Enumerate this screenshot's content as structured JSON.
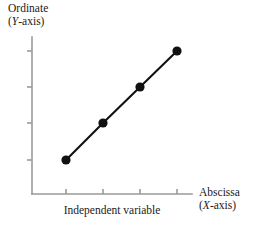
{
  "figure": {
    "background_color": "#ffffff",
    "axis_color": "#9a9a9a",
    "series_color": "#111111",
    "text_color": "#1a1a1a"
  },
  "captions": {
    "ordinate": {
      "name": "Ordinate",
      "axis_label_prefix": "(",
      "axis_letter": "Y",
      "axis_label_suffix": "-axis)"
    },
    "abscissa": {
      "name": "Abscissa",
      "axis_label_prefix": "(",
      "axis_letter": "X",
      "axis_label_suffix": "-axis)"
    }
  },
  "chart_data": {
    "type": "line",
    "title": "",
    "xlabel": "Independent variable",
    "ylabel": "Dependent variable",
    "x": [
      1,
      2,
      3,
      4
    ],
    "values": [
      1,
      2,
      3,
      4
    ],
    "xlim": [
      0,
      5
    ],
    "ylim": [
      0,
      5
    ],
    "xtick_labels": [
      "",
      "",
      "",
      ""
    ],
    "ytick_labels": [
      "",
      "",
      "",
      ""
    ],
    "grid": false,
    "legend": false,
    "marker": "filled-circle",
    "annotations": [
      "Ordinate (Y-axis)",
      "Abscissa (X-axis)"
    ],
    "pixel_geometry": {
      "y_axis_x": 32,
      "y_axis_top": 37,
      "y_axis_bottom": 194,
      "x_axis_y": 194,
      "x_axis_left": 32,
      "x_axis_right": 192,
      "x_ticks_px": [
        66,
        103,
        140,
        177
      ],
      "y_ticks_px": [
        160,
        123,
        87,
        51
      ],
      "points_px": [
        [
          66,
          160
        ],
        [
          103,
          123
        ],
        [
          140,
          87
        ],
        [
          177,
          51
        ]
      ],
      "marker_radius_px": 4.6
    }
  }
}
